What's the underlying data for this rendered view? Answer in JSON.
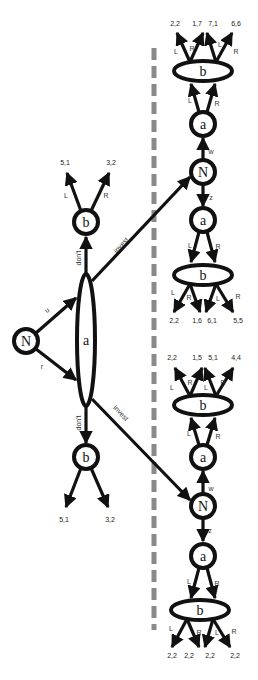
{
  "diagram": {
    "type": "extensive-form game tree",
    "divider": {
      "style": "dashed",
      "color": "#8a8a8a"
    },
    "root": {
      "label": "N",
      "edges": {
        "upper": "u",
        "lower": "r"
      }
    },
    "info_set_a": {
      "label": "a",
      "actions": {
        "up": "don't",
        "down": "don't",
        "invest": "invest"
      }
    },
    "left_top_b": {
      "label": "b",
      "edges": {
        "left": "L",
        "right": "R"
      },
      "payoffs": [
        "5,1",
        "3,2"
      ]
    },
    "left_bottom_b": {
      "label": "b",
      "payoffs": [
        "5,1",
        "3,2"
      ]
    },
    "upper_subgame": {
      "nature": {
        "label": "N",
        "edges": {
          "up": "w",
          "down": "z"
        }
      },
      "a_top": {
        "label": "a",
        "edges": {
          "left": "L",
          "right": "R"
        }
      },
      "b_top": {
        "label": "b",
        "edges": [
          "L",
          "R",
          "L",
          "R"
        ],
        "payoffs": [
          "2,2",
          "1,7",
          "7,1",
          "6,6"
        ]
      },
      "a_bottom": {
        "label": "a",
        "edges": {
          "left": "L",
          "right": "R"
        }
      },
      "b_bottom": {
        "label": "b",
        "edges": [
          "L",
          "R",
          "L",
          "R"
        ],
        "payoffs": [
          "2,2",
          "1,6",
          "6,1",
          "5,5"
        ]
      }
    },
    "lower_subgame": {
      "nature": {
        "label": "N",
        "edges": {
          "up": "w",
          "down": "z"
        }
      },
      "a_top": {
        "label": "a",
        "edges": {
          "left": "L",
          "right": "R"
        }
      },
      "b_top": {
        "label": "b",
        "edges": [
          "L",
          "R",
          "L",
          "R"
        ],
        "payoffs": [
          "2,2",
          "1,5",
          "5,1",
          "4,4"
        ]
      },
      "a_bottom": {
        "label": "a",
        "edges": {
          "left": "L",
          "right": "R"
        }
      },
      "b_bottom": {
        "label": "b",
        "edges": [
          "L",
          "R",
          "L",
          "R"
        ],
        "payoffs": [
          "2,2",
          "2,2",
          "2,2",
          "2,2"
        ]
      }
    }
  }
}
